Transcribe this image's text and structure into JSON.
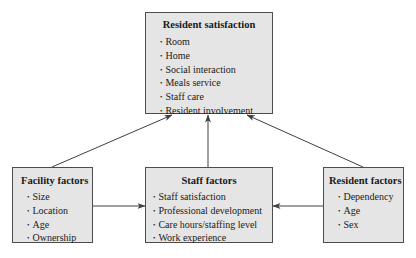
{
  "diagram": {
    "resident_satisfaction": {
      "title": "Resident satisfaction",
      "items": [
        "Room",
        "Home",
        "Social interaction",
        "Meals service",
        "Staff care",
        "Resident involvement"
      ]
    },
    "facility_factors": {
      "title": "Facility factors",
      "items": [
        "Size",
        "Location",
        "Age",
        "Ownership"
      ]
    },
    "staff_factors": {
      "title": "Staff factors",
      "items": [
        "Staff satisfaction",
        "Professional development",
        "Care hours/staffing level",
        "Work experience"
      ]
    },
    "resident_factors": {
      "title": "Resident factors",
      "items": [
        "Dependency",
        "Age",
        "Sex"
      ]
    },
    "edges": [
      {
        "from": "Facility factors",
        "to": "Resident satisfaction"
      },
      {
        "from": "Staff factors",
        "to": "Resident satisfaction"
      },
      {
        "from": "Resident factors",
        "to": "Resident satisfaction"
      },
      {
        "from": "Facility factors",
        "to": "Staff factors"
      },
      {
        "from": "Resident factors",
        "to": "Staff factors"
      }
    ],
    "colors": {
      "box_fill": "#e5e5e5",
      "box_border": "#4d4d4d",
      "arrow": "#404040"
    }
  }
}
